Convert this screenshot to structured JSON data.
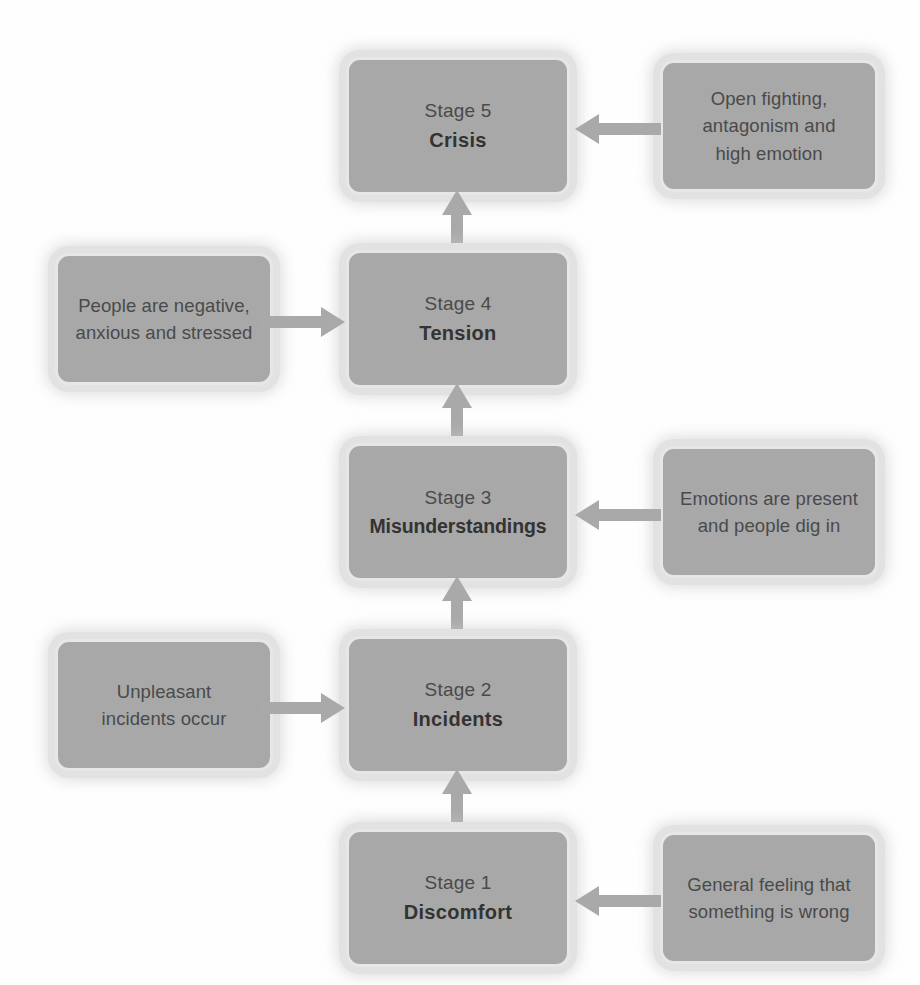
{
  "diagram": {
    "background_color": "#ffffff",
    "box_fill_color": "#a8a8a8",
    "box_border_color": "#e7e7e7",
    "arrow_color": "#a9a9a9",
    "text_color": "#3d3d3d"
  },
  "stages": [
    {
      "id": "stage-5",
      "label": "Stage 5",
      "name": "Crisis",
      "description": "Open fighting, antagonism and high emotion",
      "description_lines": [
        "Open fighting,",
        "antagonism and",
        "high emotion"
      ],
      "description_side": "right"
    },
    {
      "id": "stage-4",
      "label": "Stage 4",
      "name": "Tension",
      "description": "People are negative, anxious and stressed",
      "description_lines": [
        "People are negative,",
        "anxious and stressed"
      ],
      "description_side": "left"
    },
    {
      "id": "stage-3",
      "label": "Stage 3",
      "name": "Misunderstandings",
      "description": "Emotions are present and people dig in",
      "description_lines": [
        "Emotions are present",
        "and people dig in"
      ],
      "description_side": "right"
    },
    {
      "id": "stage-2",
      "label": "Stage 2",
      "name": "Incidents",
      "description": "Unpleasant incidents occur",
      "description_lines": [
        "Unpleasant",
        "incidents occur"
      ],
      "description_side": "left"
    },
    {
      "id": "stage-1",
      "label": "Stage 1",
      "name": "Discomfort",
      "description": "General feeling that something is wrong",
      "description_lines": [
        "General feeling that",
        "something is wrong"
      ],
      "description_side": "right"
    }
  ],
  "flow_arrows": [
    {
      "id": "arrow-stage1-to-stage2",
      "direction": "up",
      "from": "Stage 1",
      "to": "Stage 2"
    },
    {
      "id": "arrow-stage2-to-stage3",
      "direction": "up",
      "from": "Stage 2",
      "to": "Stage 3"
    },
    {
      "id": "arrow-stage3-to-stage4",
      "direction": "up",
      "from": "Stage 3",
      "to": "Stage 4"
    },
    {
      "id": "arrow-stage4-to-stage5",
      "direction": "up",
      "from": "Stage 4",
      "to": "Stage 5"
    }
  ],
  "description_arrows": [
    {
      "id": "arrow-desc-to-stage5",
      "direction": "left",
      "to": "Stage 5"
    },
    {
      "id": "arrow-desc-to-stage4",
      "direction": "right",
      "to": "Stage 4"
    },
    {
      "id": "arrow-desc-to-stage3",
      "direction": "left",
      "to": "Stage 3"
    },
    {
      "id": "arrow-desc-to-stage2",
      "direction": "right",
      "to": "Stage 2"
    },
    {
      "id": "arrow-desc-to-stage1",
      "direction": "left",
      "to": "Stage 1"
    }
  ]
}
